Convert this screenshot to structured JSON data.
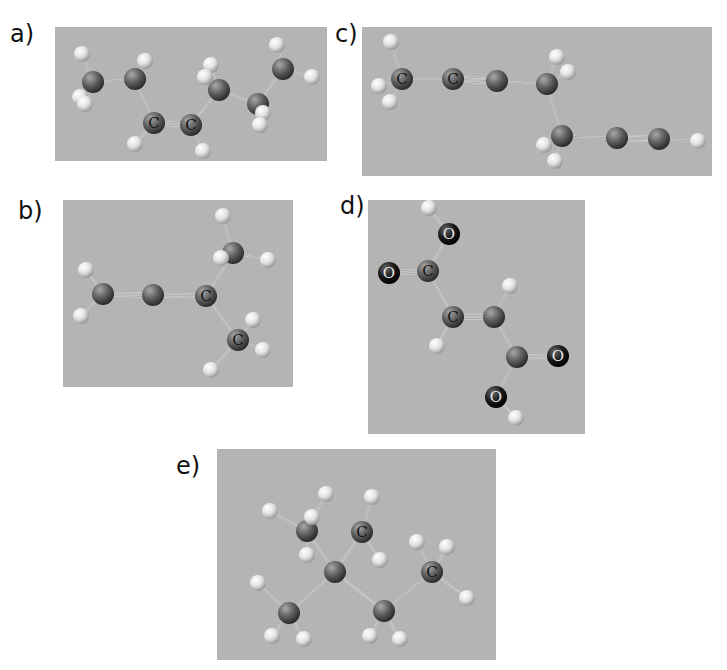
{
  "figure": {
    "background": "#ffffff",
    "panel_color": "#b4b4b4",
    "atom_colors": {
      "C": "#5e5e5e",
      "H": "#e2e2e2",
      "O": "#1c1c1c"
    },
    "panels": [
      {
        "id": "a",
        "label": "a)",
        "label_pos": [
          10,
          20
        ],
        "rect": [
          55,
          27,
          272,
          134
        ],
        "atoms": [
          {
            "t": "H",
            "x": 27,
            "y": 27
          },
          {
            "t": "C",
            "x": 38,
            "y": 55
          },
          {
            "t": "H",
            "x": 25,
            "y": 70
          },
          {
            "t": "H",
            "x": 30,
            "y": 77
          },
          {
            "t": "C",
            "x": 80,
            "y": 52
          },
          {
            "t": "H",
            "x": 90,
            "y": 34
          },
          {
            "t": "C",
            "x": 99,
            "y": 96,
            "l": "C"
          },
          {
            "t": "H",
            "x": 80,
            "y": 117
          },
          {
            "t": "C",
            "x": 136,
            "y": 98,
            "l": "C"
          },
          {
            "t": "H",
            "x": 148,
            "y": 124
          },
          {
            "t": "C",
            "x": 164,
            "y": 63
          },
          {
            "t": "H",
            "x": 156,
            "y": 38
          },
          {
            "t": "H",
            "x": 150,
            "y": 50
          },
          {
            "t": "C",
            "x": 203,
            "y": 77
          },
          {
            "t": "H",
            "x": 208,
            "y": 86
          },
          {
            "t": "H",
            "x": 205,
            "y": 98
          },
          {
            "t": "C",
            "x": 228,
            "y": 42
          },
          {
            "t": "H",
            "x": 222,
            "y": 18
          },
          {
            "t": "H",
            "x": 257,
            "y": 50
          }
        ],
        "bonds": [
          [
            0,
            1
          ],
          [
            1,
            2
          ],
          [
            1,
            3
          ],
          [
            1,
            4
          ],
          [
            4,
            5
          ],
          [
            4,
            6
          ],
          [
            6,
            7
          ],
          [
            6,
            8,
            2
          ],
          [
            8,
            9
          ],
          [
            8,
            10
          ],
          [
            10,
            11
          ],
          [
            10,
            12
          ],
          [
            10,
            13
          ],
          [
            13,
            14
          ],
          [
            13,
            15
          ],
          [
            13,
            16
          ],
          [
            16,
            17
          ],
          [
            16,
            18
          ]
        ]
      },
      {
        "id": "b",
        "label": "b)",
        "label_pos": [
          18,
          197
        ],
        "rect": [
          63,
          200,
          230,
          187
        ],
        "atoms": [
          {
            "t": "H",
            "x": 23,
            "y": 70
          },
          {
            "t": "C",
            "x": 40,
            "y": 94
          },
          {
            "t": "H",
            "x": 18,
            "y": 116
          },
          {
            "t": "C",
            "x": 90,
            "y": 95
          },
          {
            "t": "C",
            "x": 143,
            "y": 96,
            "l": "C"
          },
          {
            "t": "C",
            "x": 170,
            "y": 53
          },
          {
            "t": "H",
            "x": 160,
            "y": 16
          },
          {
            "t": "H",
            "x": 158,
            "y": 58
          },
          {
            "t": "H",
            "x": 205,
            "y": 60
          },
          {
            "t": "C",
            "x": 175,
            "y": 140,
            "l": "C"
          },
          {
            "t": "H",
            "x": 190,
            "y": 120
          },
          {
            "t": "H",
            "x": 200,
            "y": 150
          },
          {
            "t": "H",
            "x": 148,
            "y": 170
          }
        ],
        "bonds": [
          [
            0,
            1
          ],
          [
            1,
            2
          ],
          [
            1,
            3,
            2
          ],
          [
            3,
            4,
            2
          ],
          [
            4,
            5
          ],
          [
            5,
            6
          ],
          [
            5,
            7
          ],
          [
            5,
            8
          ],
          [
            4,
            9
          ],
          [
            9,
            10
          ],
          [
            9,
            11
          ],
          [
            9,
            12
          ]
        ]
      },
      {
        "id": "c",
        "label": "c)",
        "label_pos": [
          335,
          20
        ],
        "rect": [
          362,
          27,
          350,
          149
        ],
        "atoms": [
          {
            "t": "H",
            "x": 29,
            "y": 15
          },
          {
            "t": "C",
            "x": 40,
            "y": 52,
            "l": "C"
          },
          {
            "t": "H",
            "x": 17,
            "y": 59
          },
          {
            "t": "H",
            "x": 28,
            "y": 75
          },
          {
            "t": "C",
            "x": 91,
            "y": 52,
            "l": "C"
          },
          {
            "t": "C",
            "x": 135,
            "y": 54
          },
          {
            "t": "C",
            "x": 185,
            "y": 57
          },
          {
            "t": "H",
            "x": 195,
            "y": 30
          },
          {
            "t": "H",
            "x": 206,
            "y": 45
          },
          {
            "t": "C",
            "x": 200,
            "y": 109
          },
          {
            "t": "H",
            "x": 182,
            "y": 118
          },
          {
            "t": "H",
            "x": 193,
            "y": 134
          },
          {
            "t": "C",
            "x": 255,
            "y": 111
          },
          {
            "t": "C",
            "x": 297,
            "y": 112
          },
          {
            "t": "H",
            "x": 336,
            "y": 114
          }
        ],
        "bonds": [
          [
            0,
            1
          ],
          [
            1,
            2
          ],
          [
            1,
            3
          ],
          [
            1,
            4
          ],
          [
            4,
            5,
            3
          ],
          [
            5,
            6
          ],
          [
            6,
            7
          ],
          [
            6,
            8
          ],
          [
            6,
            9
          ],
          [
            9,
            10
          ],
          [
            9,
            11
          ],
          [
            9,
            12
          ],
          [
            12,
            13,
            3
          ],
          [
            13,
            14
          ]
        ]
      },
      {
        "id": "d",
        "label": "d)",
        "label_pos": [
          340,
          192
        ],
        "rect": [
          368,
          200,
          217,
          234
        ],
        "atoms": [
          {
            "t": "H",
            "x": 61,
            "y": 8
          },
          {
            "t": "O",
            "x": 81,
            "y": 34,
            "l": "O"
          },
          {
            "t": "O",
            "x": 21,
            "y": 73,
            "l": "O"
          },
          {
            "t": "C",
            "x": 60,
            "y": 71,
            "l": "C"
          },
          {
            "t": "C",
            "x": 85,
            "y": 117,
            "l": "C"
          },
          {
            "t": "H",
            "x": 69,
            "y": 146
          },
          {
            "t": "C",
            "x": 126,
            "y": 117
          },
          {
            "t": "H",
            "x": 142,
            "y": 86
          },
          {
            "t": "C",
            "x": 149,
            "y": 157
          },
          {
            "t": "O",
            "x": 190,
            "y": 156,
            "l": "O"
          },
          {
            "t": "O",
            "x": 128,
            "y": 197,
            "l": "O"
          },
          {
            "t": "H",
            "x": 148,
            "y": 218
          }
        ],
        "bonds": [
          [
            0,
            1
          ],
          [
            1,
            3
          ],
          [
            2,
            3,
            2
          ],
          [
            3,
            4
          ],
          [
            4,
            5
          ],
          [
            4,
            6,
            2
          ],
          [
            6,
            7
          ],
          [
            6,
            8
          ],
          [
            8,
            9,
            2
          ],
          [
            8,
            10
          ],
          [
            10,
            11
          ]
        ]
      },
      {
        "id": "e",
        "label": "e)",
        "label_pos": [
          176,
          452
        ],
        "rect": [
          217,
          449,
          279,
          211
        ],
        "atoms": [
          {
            "t": "H",
            "x": 53,
            "y": 62
          },
          {
            "t": "H",
            "x": 109,
            "y": 45
          },
          {
            "t": "H",
            "x": 155,
            "y": 48
          },
          {
            "t": "C",
            "x": 90,
            "y": 82
          },
          {
            "t": "H",
            "x": 95,
            "y": 68
          },
          {
            "t": "H",
            "x": 90,
            "y": 106
          },
          {
            "t": "C",
            "x": 145,
            "y": 83,
            "l": "C"
          },
          {
            "t": "H",
            "x": 163,
            "y": 111
          },
          {
            "t": "C",
            "x": 118,
            "y": 123
          },
          {
            "t": "H",
            "x": 200,
            "y": 93
          },
          {
            "t": "H",
            "x": 230,
            "y": 98
          },
          {
            "t": "C",
            "x": 215,
            "y": 123,
            "l": "C"
          },
          {
            "t": "H",
            "x": 250,
            "y": 149
          },
          {
            "t": "H",
            "x": 41,
            "y": 134
          },
          {
            "t": "C",
            "x": 72,
            "y": 164
          },
          {
            "t": "H",
            "x": 55,
            "y": 187
          },
          {
            "t": "H",
            "x": 87,
            "y": 190
          },
          {
            "t": "C",
            "x": 167,
            "y": 162
          },
          {
            "t": "H",
            "x": 153,
            "y": 187
          },
          {
            "t": "H",
            "x": 183,
            "y": 190
          }
        ],
        "bonds": [
          [
            0,
            3
          ],
          [
            1,
            3
          ],
          [
            3,
            4
          ],
          [
            3,
            5
          ],
          [
            3,
            8
          ],
          [
            2,
            6
          ],
          [
            6,
            7
          ],
          [
            6,
            8
          ],
          [
            8,
            14
          ],
          [
            8,
            17
          ],
          [
            9,
            11
          ],
          [
            10,
            11
          ],
          [
            11,
            12
          ],
          [
            11,
            17
          ],
          [
            13,
            14
          ],
          [
            14,
            15
          ],
          [
            14,
            16
          ],
          [
            17,
            18
          ],
          [
            17,
            19
          ]
        ]
      }
    ]
  }
}
